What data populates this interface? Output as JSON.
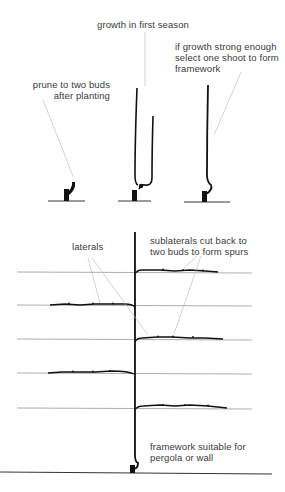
{
  "diagram": {
    "stages": [
      {
        "id": "stage-1",
        "label_lines": [
          "prune to two buds",
          "after planting"
        ]
      },
      {
        "id": "stage-2",
        "label_lines": [
          "growth in first season"
        ]
      },
      {
        "id": "stage-3",
        "label_lines": [
          "if growth strong enough",
          "select one shoot to form",
          "framework"
        ]
      }
    ],
    "framework": {
      "labels": {
        "laterals": "laterals",
        "sublaterals_lines": [
          "sublaterals cut back to",
          "two buds to form spurs"
        ],
        "framework_lines": [
          "framework suitable for",
          "pergola or wall"
        ]
      },
      "wires": [
        {
          "y": 272,
          "lateral_side": "right",
          "lateral_from": 135,
          "lateral_to": 218
        },
        {
          "y": 305,
          "lateral_side": "left",
          "lateral_from": 50,
          "lateral_to": 134
        },
        {
          "y": 339,
          "lateral_side": "right",
          "lateral_from": 135,
          "lateral_to": 223
        },
        {
          "y": 373,
          "lateral_side": "left",
          "lateral_from": 48,
          "lateral_to": 134
        },
        {
          "y": 408,
          "lateral_side": "right",
          "lateral_from": 135,
          "lateral_to": 227
        }
      ]
    },
    "colors": {
      "ink": "#111111",
      "wire": "#8a8a8a",
      "leader": "#b5b5b5",
      "text": "#3a3a3a"
    }
  }
}
